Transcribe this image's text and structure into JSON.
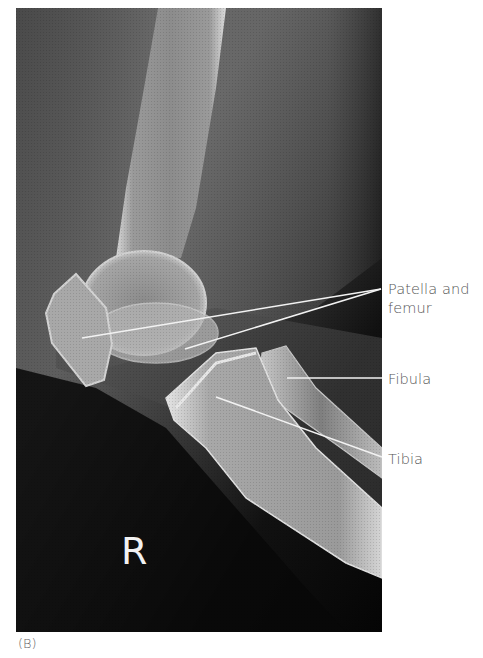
{
  "figure": {
    "panel_caption": "(B)",
    "view": "Lateral radiograph of knee",
    "side_marker": "R",
    "labels": [
      {
        "id": "patella-and-femur",
        "text": "Patella and\nfemur"
      },
      {
        "id": "fibula",
        "text": "Fibula"
      },
      {
        "id": "tibia",
        "text": "Tibia"
      }
    ],
    "leader_lines": [
      {
        "label": "patella-and-femur",
        "from": [
          82,
          338
        ],
        "to": [
          381,
          289
        ]
      },
      {
        "label": "patella-and-femur",
        "from": [
          185,
          349
        ],
        "to": [
          381,
          289
        ]
      },
      {
        "label": "fibula",
        "from": [
          287,
          378
        ],
        "to": [
          382,
          378
        ]
      },
      {
        "label": "tibia",
        "from": [
          216,
          397
        ],
        "to": [
          382,
          457
        ]
      }
    ]
  }
}
